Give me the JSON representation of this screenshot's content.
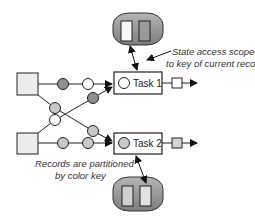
{
  "diagram": {
    "annotations": {
      "state_access_line1": "State access scoped",
      "state_access_line2": "to key of current record",
      "partition_line1": "Records are partitioned",
      "partition_line2": "by color key"
    },
    "tasks": [
      {
        "label": "Task 1",
        "record_color": "#ffffff",
        "output_color": "#ffffff"
      },
      {
        "label": "Task 2",
        "record_color": "#c8c8c8",
        "output_color": "#d4d4d4"
      }
    ],
    "colors": {
      "source_fill": "#ececec",
      "dark_record": "#8f8f8f",
      "light_record": "#ffffff",
      "mid_record": "#c8c8c8",
      "state_store_fill": "#9a9a9a",
      "stroke": "#222222"
    }
  }
}
